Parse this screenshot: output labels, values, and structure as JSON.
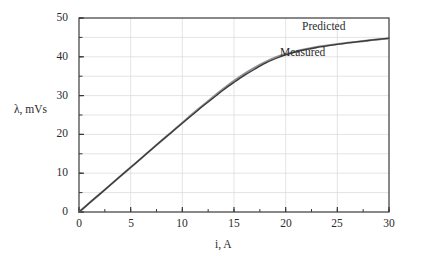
{
  "chart_data": {
    "type": "line",
    "title": "",
    "xlabel": "i, A",
    "ylabel": "λ, mVs",
    "xlim": [
      0,
      30
    ],
    "ylim": [
      0,
      50
    ],
    "xticks": [
      0,
      5,
      10,
      15,
      20,
      25,
      30
    ],
    "yticks": [
      0,
      10,
      20,
      30,
      40,
      50
    ],
    "xminor_step": 2.5,
    "yminor_step": 5,
    "grid": true,
    "grid_color": "#d8d8dc",
    "legend_position": "inline-annotation",
    "series": [
      {
        "name": "Predicted",
        "color": "#3a3a3a",
        "x": [
          0,
          1,
          2,
          3,
          4,
          5,
          6,
          7,
          8,
          9,
          10,
          11,
          12,
          13,
          14,
          15,
          16,
          17,
          18,
          19,
          20,
          21,
          22,
          23,
          24,
          25,
          26,
          27,
          28,
          29,
          30
        ],
        "values": [
          0.0,
          2.3,
          4.6,
          6.9,
          9.2,
          11.5,
          13.8,
          16.1,
          18.4,
          20.6,
          22.9,
          25.1,
          27.3,
          29.4,
          31.5,
          33.4,
          35.2,
          36.8,
          38.3,
          39.5,
          40.5,
          41.3,
          41.9,
          42.4,
          42.8,
          43.2,
          43.6,
          43.9,
          44.2,
          44.5,
          44.8
        ]
      },
      {
        "name": "Measured",
        "color": "#8f8f94",
        "x": [
          0,
          1,
          2,
          3,
          4,
          5,
          6,
          7,
          8,
          9,
          10,
          11,
          12,
          13,
          14,
          15,
          16,
          17,
          18,
          19,
          20,
          21,
          22,
          23,
          24,
          25,
          26,
          27,
          28,
          29,
          30
        ],
        "values": [
          0.0,
          2.3,
          4.6,
          6.9,
          9.2,
          11.5,
          13.8,
          16.1,
          18.4,
          20.7,
          23.0,
          25.3,
          27.5,
          29.7,
          31.8,
          33.8,
          35.6,
          37.2,
          38.6,
          39.8,
          40.7,
          41.4,
          42.0,
          42.5,
          42.9,
          43.3,
          43.6,
          43.9,
          44.2,
          44.5,
          44.7
        ]
      }
    ],
    "annotations": [
      {
        "text": "Predicted",
        "x": 24.2,
        "y": 47.2
      },
      {
        "text": "Measured",
        "x": 22.0,
        "y": 40.6
      }
    ]
  }
}
